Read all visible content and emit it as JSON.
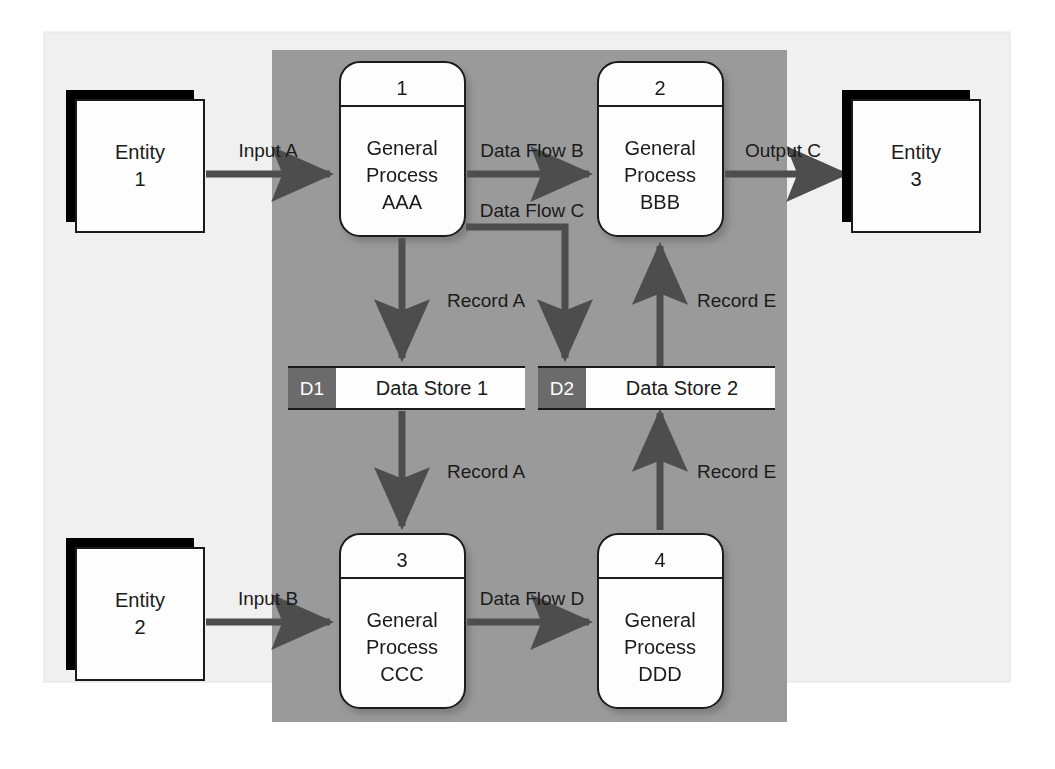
{
  "diagram": {
    "colors": {
      "page_background": "#ffffff",
      "frame_background": "#f0f0f0",
      "context_panel": "#9a9a9a",
      "shape_fill": "#fdfdfd",
      "shape_stroke": "#1a1a1a",
      "arrow": "#4d4d4d",
      "store_id_fill": "#6b6b6b",
      "entity_shadow": "#000000",
      "text": "#1a1a1a"
    },
    "frame": {
      "x": 44,
      "y": 32,
      "width": 966,
      "height": 650
    },
    "context_panel": {
      "x": 272,
      "y": 50,
      "width": 515,
      "height": 672
    }
  },
  "entities": [
    {
      "id": "entity-1",
      "line1": "Entity",
      "line2": "1",
      "x": 76,
      "y": 100,
      "width": 128,
      "height": 132
    },
    {
      "id": "entity-2",
      "line1": "Entity",
      "line2": "2",
      "x": 76,
      "y": 548,
      "width": 128,
      "height": 132
    },
    {
      "id": "entity-3",
      "line1": "Entity",
      "line2": "3",
      "x": 852,
      "y": 100,
      "width": 128,
      "height": 132
    }
  ],
  "processes": [
    {
      "id": "process-1",
      "number": "1",
      "line1": "General",
      "line2": "Process",
      "line3": "AAA",
      "x": 340,
      "y": 62,
      "width": 125,
      "height": 174
    },
    {
      "id": "process-2",
      "number": "2",
      "line1": "General",
      "line2": "Process",
      "line3": "BBB",
      "x": 598,
      "y": 62,
      "width": 125,
      "height": 174
    },
    {
      "id": "process-3",
      "number": "3",
      "line1": "General",
      "line2": "Process",
      "line3": "CCC",
      "x": 340,
      "y": 534,
      "width": 125,
      "height": 174
    },
    {
      "id": "process-4",
      "number": "4",
      "line1": "General",
      "line2": "Process",
      "line3": "DDD",
      "x": 598,
      "y": 534,
      "width": 125,
      "height": 174
    }
  ],
  "data_stores": [
    {
      "id": "data-store-1",
      "code": "D1",
      "label": "Data Store 1",
      "x": 288,
      "y": 367,
      "width": 237,
      "height": 42,
      "id_width": 48
    },
    {
      "id": "data-store-2",
      "code": "D2",
      "label": "Data Store 2",
      "x": 538,
      "y": 367,
      "width": 237,
      "height": 42,
      "id_width": 48
    }
  ],
  "flows": [
    {
      "id": "flow-input-a",
      "label": "Input A",
      "from": "entity-1",
      "to": "process-1",
      "label_x": 268,
      "label_y": 157
    },
    {
      "id": "flow-data-flow-b",
      "label": "Data Flow B",
      "from": "process-1",
      "to": "process-2",
      "label_x": 532,
      "label_y": 157
    },
    {
      "id": "flow-output-c",
      "label": "Output C",
      "from": "process-2",
      "to": "entity-3",
      "label_x": 783,
      "label_y": 157
    },
    {
      "id": "flow-data-flow-c",
      "label": "Data Flow C",
      "from": "process-1",
      "to": "data-store-2",
      "label_x": 532,
      "label_y": 217
    },
    {
      "id": "flow-record-a-upper",
      "label": "Record A",
      "from": "process-1",
      "to": "data-store-1",
      "label_x": 447,
      "label_y": 307
    },
    {
      "id": "flow-record-e-upper",
      "label": "Record E",
      "from": "data-store-2",
      "to": "process-2",
      "label_x": 697,
      "label_y": 307
    },
    {
      "id": "flow-record-a-lower",
      "label": "Record A",
      "from": "data-store-1",
      "to": "process-3",
      "label_x": 447,
      "label_y": 478
    },
    {
      "id": "flow-record-e-lower",
      "label": "Record E",
      "from": "process-4",
      "to": "data-store-2",
      "label_x": 697,
      "label_y": 478
    },
    {
      "id": "flow-input-b",
      "label": "Input B",
      "from": "entity-2",
      "to": "process-3",
      "label_x": 268,
      "label_y": 605
    },
    {
      "id": "flow-data-flow-d",
      "label": "Data Flow D",
      "from": "process-3",
      "to": "process-4",
      "label_x": 532,
      "label_y": 605
    }
  ]
}
